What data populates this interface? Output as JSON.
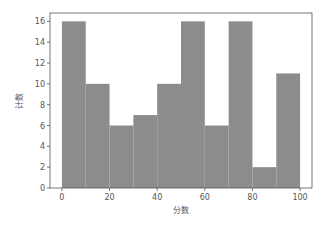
{
  "chart_data": {
    "type": "bar",
    "subtype": "histogram",
    "title": "",
    "xlabel": "分数",
    "ylabel": "计数",
    "bin_edges": [
      0,
      10,
      20,
      30,
      40,
      50,
      60,
      70,
      80,
      90,
      100
    ],
    "categories": [
      "0-10",
      "10-20",
      "20-30",
      "30-40",
      "40-50",
      "50-60",
      "60-70",
      "70-80",
      "80-90",
      "90-100"
    ],
    "values": [
      16,
      10,
      6,
      7,
      10,
      16,
      6,
      16,
      2,
      11
    ],
    "xlim": [
      -5,
      105
    ],
    "ylim": [
      0,
      16.8
    ],
    "xticks": [
      0,
      20,
      40,
      60,
      80,
      100
    ],
    "yticks": [
      0,
      2,
      4,
      6,
      8,
      10,
      12,
      14,
      16
    ],
    "grid": false,
    "legend": null,
    "bar_color": "#8c8c8c"
  }
}
